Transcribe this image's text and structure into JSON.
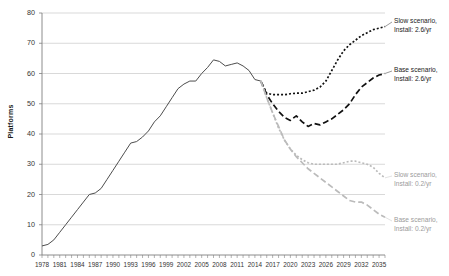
{
  "chart_data": {
    "type": "line",
    "title": "",
    "xlabel": "",
    "ylabel": "Platforms",
    "xlim": [
      1978,
      2036
    ],
    "ylim": [
      0,
      80
    ],
    "grid": true,
    "grid_axis": "y",
    "legend_position": "inline-right-annotations",
    "ytick_labels": [
      "0",
      "10",
      "20",
      "30",
      "40",
      "50",
      "60",
      "70",
      "80"
    ],
    "ytick_values": [
      0,
      10,
      20,
      30,
      40,
      50,
      60,
      70,
      80
    ],
    "xtick_labels": [
      "1978",
      "1981",
      "1984",
      "1987",
      "1990",
      "1993",
      "1996",
      "1999",
      "2002",
      "2005",
      "2008",
      "2011",
      "2014",
      "2017",
      "2020",
      "2023",
      "2026",
      "2029",
      "2032",
      "2035"
    ],
    "xtick_values": [
      1978,
      1981,
      1984,
      1987,
      1990,
      1993,
      1996,
      1999,
      2002,
      2005,
      2008,
      2011,
      2014,
      2017,
      2020,
      2023,
      2026,
      2029,
      2032,
      2035
    ],
    "minor_tick_interval": 1,
    "series": [
      {
        "name": "Historical",
        "style": "solid",
        "color": "#4d4d4d",
        "x": [
          1978,
          1979,
          1980,
          1981,
          1982,
          1983,
          1984,
          1985,
          1986,
          1987,
          1988,
          1989,
          1990,
          1991,
          1992,
          1993,
          1994,
          1995,
          1996,
          1997,
          1998,
          1999,
          2000,
          2001,
          2002,
          2003,
          2004,
          2005,
          2006,
          2007,
          2008,
          2009,
          2010,
          2011,
          2012,
          2013,
          2014,
          2015
        ],
        "values": [
          3,
          3.5,
          5,
          7.5,
          10,
          12.5,
          15,
          17.5,
          20,
          20.5,
          22,
          25,
          28,
          31,
          34,
          37,
          37.5,
          39,
          41,
          44,
          46,
          49,
          52,
          55,
          56.5,
          57.5,
          57.5,
          60,
          62,
          64.5,
          64,
          62.5,
          63,
          63.5,
          62.5,
          61,
          58,
          57.5
        ]
      },
      {
        "name": "Slow scenario, Install: 2.6/yr",
        "style": "dotted",
        "color": "#111111",
        "x": [
          2015,
          2016,
          2017,
          2018,
          2019,
          2020,
          2021,
          2022,
          2023,
          2024,
          2025,
          2026,
          2027,
          2028,
          2029,
          2030,
          2031,
          2032,
          2033,
          2034,
          2035,
          2036
        ],
        "values": [
          57.5,
          53.5,
          53,
          53,
          53,
          53.3,
          53.5,
          53.5,
          54,
          54.5,
          55.5,
          57.5,
          61,
          64.5,
          67.5,
          69.5,
          71,
          72.5,
          73.5,
          74.5,
          75,
          75.5
        ]
      },
      {
        "name": "Base scenario, Install: 2.6/yr",
        "style": "dashed",
        "color": "#111111",
        "x": [
          2015,
          2016,
          2017,
          2018,
          2019,
          2020,
          2021,
          2022,
          2023,
          2024,
          2025,
          2026,
          2027,
          2028,
          2029,
          2030,
          2031,
          2032,
          2033,
          2034,
          2035,
          2036
        ],
        "values": [
          57.5,
          53,
          50,
          47.5,
          45.5,
          44.5,
          46,
          44,
          42.5,
          43.5,
          43,
          44,
          45,
          46.5,
          48,
          50,
          53,
          55.5,
          57,
          58.5,
          59.5,
          60
        ]
      },
      {
        "name": "Slow scenario, Install: 0.2/yr",
        "style": "dotted",
        "color": "#bbbbbb",
        "x": [
          2015,
          2016,
          2017,
          2018,
          2019,
          2020,
          2021,
          2022,
          2023,
          2024,
          2025,
          2026,
          2027,
          2028,
          2029,
          2030,
          2031,
          2032,
          2033,
          2034,
          2035,
          2036
        ],
        "values": [
          57.5,
          52,
          47,
          42,
          38,
          35,
          33,
          31.5,
          30.5,
          30,
          30,
          30,
          30,
          30,
          30.5,
          31,
          31,
          30.5,
          30,
          29,
          27,
          25.5
        ]
      },
      {
        "name": "Base scenario, Install: 0.2/yr",
        "style": "dashed",
        "color": "#bbbbbb",
        "x": [
          2015,
          2016,
          2017,
          2018,
          2019,
          2020,
          2021,
          2022,
          2023,
          2024,
          2025,
          2026,
          2027,
          2028,
          2029,
          2030,
          2031,
          2032,
          2033,
          2034,
          2035,
          2036
        ],
        "values": [
          57.5,
          52,
          47,
          42.5,
          38,
          35,
          32.5,
          30.5,
          28.5,
          27,
          25.5,
          24,
          22.5,
          21,
          19.5,
          18,
          17.5,
          17.5,
          16.5,
          15,
          13.5,
          12.5
        ]
      }
    ],
    "annotations": [
      {
        "id": "slow-26",
        "line1": "Slow scenario,",
        "line2": "Install: 2.6/yr",
        "muted": false
      },
      {
        "id": "base-26",
        "line1": "Base scenario,",
        "line2": "Install: 2.6/yr",
        "muted": false
      },
      {
        "id": "slow-02",
        "line1": "Slow scenario,",
        "line2": "Install: 0.2/yr",
        "muted": true
      },
      {
        "id": "base-02",
        "line1": "Base scenario,",
        "line2": "Install: 0.2/yr",
        "muted": true
      }
    ],
    "colors": {
      "axis": "#808080",
      "grid": "#c8c8c8",
      "historical": "#4d4d4d",
      "projection_dark": "#111111",
      "projection_light": "#bbbbbb",
      "background": "#ffffff"
    }
  }
}
